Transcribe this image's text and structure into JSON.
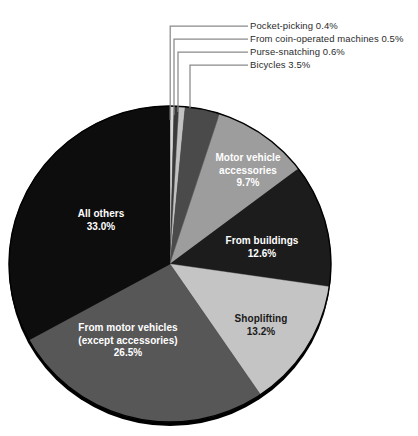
{
  "chart_data": {
    "type": "pie",
    "title": "",
    "subtitle": "",
    "xlabel": "",
    "ylabel": "",
    "legend_position": "none",
    "grid": false,
    "units": "percent",
    "start_angle_deg": 0,
    "direction": "clockwise",
    "categories": [
      "Pocket-picking",
      "From coin-operated machines",
      "Purse-snatching",
      "Bicycles",
      "Motor vehicle accessories",
      "From buildings",
      "Shoplifting",
      "From motor vehicles (except accessories)",
      "All others"
    ],
    "values": [
      0.4,
      0.5,
      0.6,
      3.5,
      9.7,
      12.6,
      13.2,
      26.5,
      33.0
    ],
    "slices": [
      {
        "label": "Pocket-picking",
        "value": 0.4,
        "value_text": "0.4%",
        "callout_text": "Pocket-picking 0.4%",
        "color": "#d8d8d8",
        "label_placement": "callout"
      },
      {
        "label": "From coin-operated machines",
        "value": 0.5,
        "value_text": "0.5%",
        "callout_text": "From coin-operated machines 0.5%",
        "color": "#3a3a3a",
        "label_placement": "callout"
      },
      {
        "label": "Purse-snatching",
        "value": 0.6,
        "value_text": "0.6%",
        "callout_text": "Purse-snatching 0.6%",
        "color": "#c2c2c2",
        "label_placement": "callout"
      },
      {
        "label": "Bicycles",
        "value": 3.5,
        "value_text": "3.5%",
        "callout_text": "Bicycles 3.5%",
        "color": "#4a4a4a",
        "label_placement": "callout"
      },
      {
        "label": "Motor vehicle accessories",
        "value": 9.7,
        "value_text": "9.7%",
        "line1": "Motor vehicle",
        "line2": "accessories",
        "color": "#9d9d9d",
        "label_placement": "inside",
        "label_color": "on-dark"
      },
      {
        "label": "From buildings",
        "value": 12.6,
        "value_text": "12.6%",
        "line1": "From buildings",
        "color": "#1c1c1c",
        "label_placement": "inside",
        "label_color": "on-dark"
      },
      {
        "label": "Shoplifting",
        "value": 13.2,
        "value_text": "13.2%",
        "line1": "Shoplifting",
        "color": "#c4c4c4",
        "label_placement": "inside",
        "label_color": "on-light"
      },
      {
        "label": "From motor vehicles (except accessories)",
        "value": 26.5,
        "value_text": "26.5%",
        "line1": "From motor vehicles",
        "line2": "(except accessories)",
        "color": "#575757",
        "label_placement": "inside",
        "label_color": "on-dark"
      },
      {
        "label": "All others",
        "value": 33.0,
        "value_text": "33.0%",
        "line1": "All others",
        "color": "#0d0d0d",
        "label_placement": "inside",
        "label_color": "on-dark"
      }
    ]
  },
  "callouts": {
    "pocket_picking": "Pocket-picking 0.4%",
    "coin_operated": "From coin-operated machines 0.5%",
    "purse_snatching": "Purse-snatching 0.6%",
    "bicycles": "Bicycles 3.5%"
  },
  "inside_labels": {
    "motor_accessories_l1": "Motor vehicle",
    "motor_accessories_l2": "accessories",
    "motor_accessories_pct": "9.7%",
    "from_buildings_l1": "From buildings",
    "from_buildings_pct": "12.6%",
    "shoplifting_l1": "Shoplifting",
    "shoplifting_pct": "13.2%",
    "from_motor_vehicles_l1": "From motor vehicles",
    "from_motor_vehicles_l2": "(except accessories)",
    "from_motor_vehicles_pct": "26.5%",
    "all_others_l1": "All others",
    "all_others_pct": "33.0%"
  },
  "colors": {
    "background": "#ffffff",
    "leader_line": "#8a8a8a",
    "pie_rim": "#000000",
    "text_dark": "#2b2b2b",
    "text_light": "#ffffff"
  }
}
